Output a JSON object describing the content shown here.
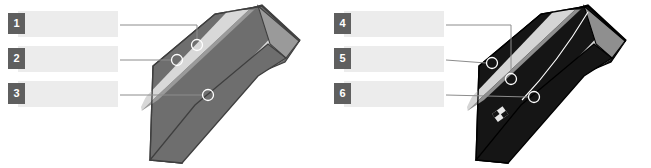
{
  "page": {
    "background_color": "#ffffff",
    "width": 651,
    "height": 168
  },
  "colors": {
    "badge_fill": "#5f5f5f",
    "badge_text": "#ffffff",
    "blank_box_fill": "#ececec",
    "leader_line": "#8c8c8c",
    "marker_stroke": "#ffffff",
    "tie_light_dark_stripe": "#6e6e6e",
    "tie_light_mid_stripe": "#9a9a9a",
    "tie_light_pale_stripe": "#d8d8d8",
    "tie_light_outline": "#3f3f3f",
    "tie_dark_base": "#151515",
    "tie_dark_mid_stripe": "#8f8f8f",
    "tie_dark_pale_stripe": "#d5d5d5",
    "tie_dark_outline": "#000000",
    "label_patch": "#e8e8e8"
  },
  "panels": [
    {
      "id": "panel-left",
      "name": "light-striped-tie-diagram",
      "garment": "light-grey-striped-necktie",
      "callouts": [
        {
          "number": "1",
          "answer": "",
          "placeholder": ""
        },
        {
          "number": "2",
          "answer": "",
          "placeholder": ""
        },
        {
          "number": "3",
          "answer": "",
          "placeholder": ""
        }
      ]
    },
    {
      "id": "panel-right",
      "name": "dark-striped-tie-diagram",
      "garment": "black-striped-necktie-with-label",
      "callouts": [
        {
          "number": "4",
          "answer": "",
          "placeholder": ""
        },
        {
          "number": "5",
          "answer": "",
          "placeholder": ""
        },
        {
          "number": "6",
          "answer": "",
          "placeholder": ""
        }
      ]
    }
  ]
}
